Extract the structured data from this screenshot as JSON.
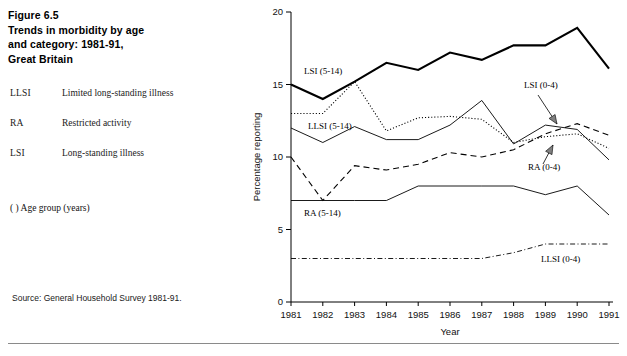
{
  "figure": {
    "title_lines": [
      "Figure 6.5",
      "Trends in morbidity by age",
      "and category: 1981-91,",
      "Great Britain"
    ],
    "source": "Source: General Household Survey 1981-91.",
    "age_group_note": "(  ) Age group (years)"
  },
  "definitions": [
    {
      "abbr": "LLSI",
      "text": "Limited long-standing illness"
    },
    {
      "abbr": "RA",
      "text": "Restricted activity"
    },
    {
      "abbr": "LSI",
      "text": "Long-standing illness"
    }
  ],
  "chart_data": {
    "type": "line",
    "title": "Trends in morbidity by age and category: 1981-91, Great Britain",
    "xlabel": "Year",
    "ylabel": "Percentage reporting",
    "x": [
      1981,
      1982,
      1983,
      1984,
      1985,
      1986,
      1987,
      1988,
      1989,
      1990,
      1991
    ],
    "xtick_labels": [
      "1981",
      "1982",
      "1983",
      "1984",
      "1985",
      "1986",
      "1987",
      "1988",
      "1989",
      "1990",
      "1991"
    ],
    "ytick_labels": [
      "0",
      "5",
      "10",
      "15",
      "20"
    ],
    "yticks": [
      0,
      5,
      10,
      15,
      20
    ],
    "ylim": [
      0,
      20
    ],
    "xlim": [
      1981,
      1991
    ],
    "grid": false,
    "legend_position": "inline-annotations",
    "series": [
      {
        "name": "LSI (5-14)",
        "label": "LSI (5-14)",
        "style": "thick-solid",
        "values": [
          15.0,
          14.0,
          15.2,
          16.5,
          16.0,
          17.2,
          16.7,
          17.7,
          17.7,
          18.9,
          16.1
        ]
      },
      {
        "name": "LLSI (5-14)",
        "label": "LLSI (5-14)",
        "style": "thin-solid",
        "values": [
          12.0,
          11.0,
          12.1,
          11.2,
          11.2,
          12.2,
          13.9,
          10.9,
          12.2,
          11.9,
          9.8
        ]
      },
      {
        "name": "RA (5-14)",
        "label": "RA (5-14)",
        "style": "thin-solid",
        "values": [
          7.0,
          7.0,
          7.0,
          7.0,
          8.0,
          8.0,
          8.0,
          8.0,
          7.4,
          8.0,
          6.0
        ]
      },
      {
        "name": "RA (0-4)",
        "label": "RA (0-4)",
        "style": "dotted",
        "values": [
          13.0,
          13.0,
          15.2,
          11.8,
          12.7,
          12.8,
          12.6,
          11.0,
          11.4,
          11.6,
          10.6
        ]
      },
      {
        "name": "LSI (0-4)",
        "label": "LSI (0-4)",
        "style": "dashed",
        "values": [
          10.0,
          7.0,
          9.4,
          9.1,
          9.5,
          10.3,
          10.0,
          10.5,
          11.6,
          12.3,
          11.5
        ]
      },
      {
        "name": "LLSI (0-4)",
        "label": "LLSI (0-4)",
        "style": "dash-dot",
        "values": [
          3.0,
          3.0,
          3.0,
          3.0,
          3.0,
          3.0,
          3.0,
          3.4,
          4.0,
          4.0,
          4.0
        ]
      }
    ],
    "annotations": [
      {
        "text": "LSI (5-14)",
        "anchor": "left"
      },
      {
        "text": "LLSI (5-14)",
        "anchor": "left"
      },
      {
        "text": "RA (5-14)",
        "anchor": "left"
      },
      {
        "text": "LSI (0-4)",
        "anchor": "right",
        "arrow": true
      },
      {
        "text": "RA (0-4)",
        "anchor": "right",
        "arrow": true
      },
      {
        "text": "LLSI (0-4)",
        "anchor": "right"
      }
    ]
  },
  "colors": {
    "ink": "#000000",
    "rule": "#8a8a8a",
    "arrow_fill": "#808080"
  }
}
